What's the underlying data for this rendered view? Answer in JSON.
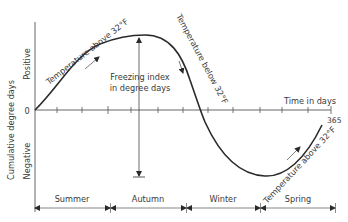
{
  "diagram": {
    "title": "",
    "y_axis": {
      "label": "Cumulative degree days",
      "positive_label": "Positive",
      "negative_label": "Negative",
      "zero_label": "0"
    },
    "x_axis": {
      "label": "Time in days",
      "end_label": "365",
      "tick_count": 12
    },
    "curve_annotations": {
      "rising": "Temperature above 32°F",
      "falling": "Temperature below 32°F",
      "spring_rising": "Temperature above 32°F"
    },
    "freezing_index": {
      "line1": "Freezing index",
      "line2": "in degree days"
    },
    "seasons": [
      {
        "label": "Summer"
      },
      {
        "label": "Autumn"
      },
      {
        "label": "Winter"
      },
      {
        "label": "Spring"
      }
    ],
    "colors": {
      "line": "#2a2a2a",
      "text": "#3a3a3a",
      "background": "#ffffff"
    }
  }
}
